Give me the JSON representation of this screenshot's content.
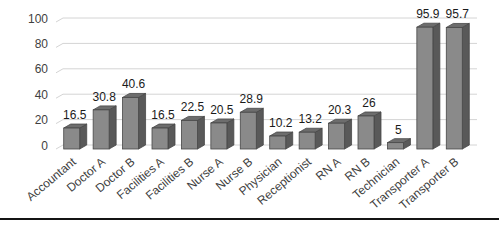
{
  "chart_data": {
    "type": "bar",
    "style": "3d-column",
    "title": "",
    "xlabel": "",
    "ylabel": "",
    "categories": [
      "Accountant",
      "Doctor A",
      "Doctor B",
      "Facilities A",
      "Facilities B",
      "Nurse A",
      "Nurse B",
      "Physician",
      "Receptionist",
      "RN A",
      "RN B",
      "Technician",
      "Transporter A",
      "Transporter B"
    ],
    "values": [
      16.5,
      30.8,
      40.6,
      16.5,
      22.5,
      20.5,
      28.9,
      10.2,
      13.2,
      20.3,
      26,
      5,
      95.9,
      95.7
    ],
    "data_labels": [
      "16.5",
      "30.8",
      "40.6",
      "16.5",
      "22.5",
      "20.5",
      "28.9",
      "10.2",
      "13.2",
      "20.3",
      "26",
      "5",
      "95.9",
      "95.7"
    ],
    "ylim": [
      0,
      100
    ],
    "yticks": [
      0,
      20,
      40,
      60,
      80,
      100
    ],
    "grid": true,
    "legend": false,
    "colors": {
      "bar_front": "#8a8a8a",
      "bar_side": "#595959",
      "bar_top": "#6d6d6d",
      "bar_outline": "#474747",
      "gridline": "#d4d4d4",
      "tick_text": "#3f3f3f",
      "category_text": "#3f3f3f",
      "value_text": "#1a1a1a",
      "separator": "#141414",
      "background": "#ffffff"
    }
  },
  "separator": {
    "present": true
  }
}
